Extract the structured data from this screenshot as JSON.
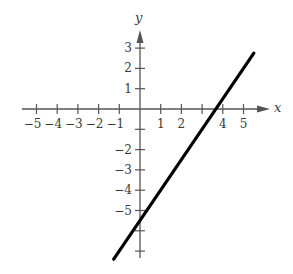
{
  "chart_data": {
    "type": "line",
    "title": "",
    "xlabel": "x",
    "ylabel": "y",
    "xlim": [
      -5.5,
      6.1
    ],
    "ylim": [
      -7.4,
      3.8
    ],
    "grid": false,
    "legend": null,
    "x_ticks": [
      -5,
      -4,
      -3,
      -2,
      -1,
      1,
      2,
      3,
      4,
      5
    ],
    "x_tick_labels": [
      "−5",
      "−4",
      "−3",
      "−2",
      "−1",
      "1",
      "2",
      "",
      "4",
      "5"
    ],
    "y_ticks": [
      3,
      2,
      1,
      -1,
      -2,
      -3,
      -4,
      -5,
      -6,
      -7
    ],
    "y_tick_labels": [
      "3",
      "2",
      "1",
      "",
      "−2",
      "−3",
      "−4",
      "−5",
      "",
      ""
    ],
    "series": [
      {
        "name": "line",
        "equation": "y = 1.5x - 5.5",
        "slope": 1.5,
        "intercept": -5.5,
        "x": [
          -1.27,
          5.5
        ],
        "y": [
          -7.4,
          2.75
        ],
        "x_intercept": 3.67,
        "y_intercept": -5.5,
        "color": "#000000"
      }
    ]
  },
  "labels": {
    "x_axis": "x",
    "y_axis": "y"
  }
}
